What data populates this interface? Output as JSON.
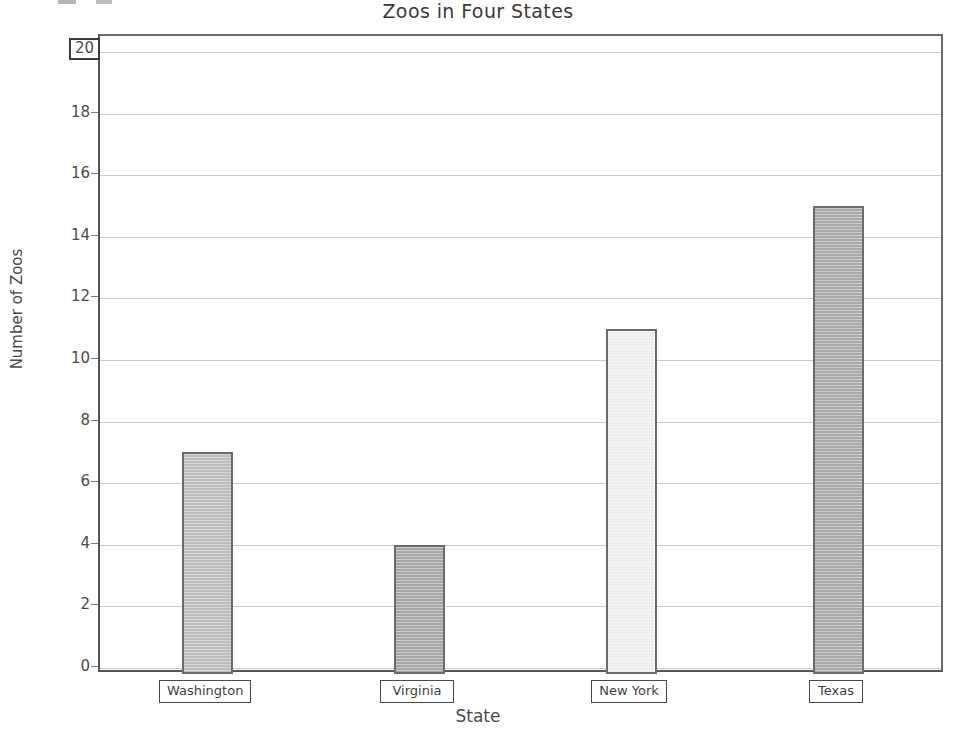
{
  "chart_data": {
    "type": "bar",
    "title": "Zoos in Four States",
    "xlabel": "State",
    "ylabel": "Number of Zoos",
    "categories": [
      "Washington",
      "Virginia",
      "New York",
      "Texas"
    ],
    "values": [
      7,
      4,
      11,
      15
    ],
    "series": [
      {
        "name": "Number of Zoos",
        "values": [
          7,
          4,
          11,
          15
        ]
      }
    ],
    "ylim": [
      0,
      20
    ],
    "yticks": [
      0,
      2,
      4,
      6,
      8,
      10,
      12,
      14,
      16,
      18,
      20
    ],
    "ytick_labels": [
      "0",
      "2",
      "4",
      "6",
      "8",
      "10",
      "12",
      "14",
      "16",
      "18",
      "20"
    ],
    "grid": true,
    "legend": false,
    "selected_ytick": "20",
    "bar_colors": [
      "#bdbdbd",
      "#a6a6a6",
      "#eeeeee",
      "#a8a8a8"
    ],
    "bar_border_color": "#6b6b6b",
    "gridline_color": "#c9c9c9",
    "axis_color": "#555555"
  }
}
